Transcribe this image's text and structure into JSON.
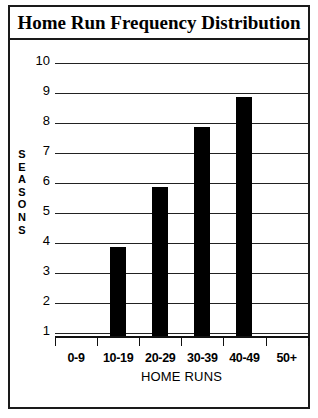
{
  "chart_data": {
    "type": "bar",
    "title": "Home Run Frequency Distribution",
    "xlabel": "HOME RUNS",
    "ylabel": "SEASONS",
    "categories": [
      "0-9",
      "10-19",
      "20-29",
      "30-39",
      "40-49",
      "50+"
    ],
    "values": [
      0,
      3,
      5,
      7,
      8,
      0
    ],
    "yticks": [
      1,
      2,
      3,
      4,
      5,
      6,
      7,
      8,
      9,
      10
    ],
    "ylim": [
      0,
      10
    ],
    "grid": true,
    "legend": "none",
    "bar_color": "#000000",
    "axis_color": "#111111",
    "background_color": "#ffffff"
  },
  "ylabel_letters": [
    "S",
    "E",
    "A",
    "S",
    "O",
    "N",
    "S"
  ]
}
